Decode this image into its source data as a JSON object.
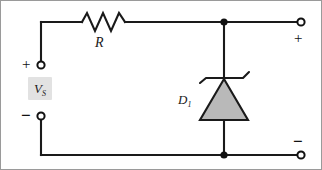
{
  "figure": {
    "type": "circuit-schematic",
    "frame_border_color": "#9a9a9a",
    "wire_color": "#1a1a1a",
    "diode_fill_color": "#b9b9b9",
    "highlight_color": "#e2e2e2"
  },
  "components": {
    "resistor": {
      "label": "R",
      "name": "series-resistor",
      "zigzag_peaks": 3
    },
    "diode": {
      "label": "D",
      "subscript": "1",
      "name": "zener-diode",
      "kind": "zener"
    },
    "source": {
      "label": "V",
      "subscript": "S",
      "name": "source-voltage"
    }
  },
  "terminals": {
    "source_positive": "+",
    "source_negative": "−",
    "output_positive": "+",
    "output_negative": "−"
  }
}
